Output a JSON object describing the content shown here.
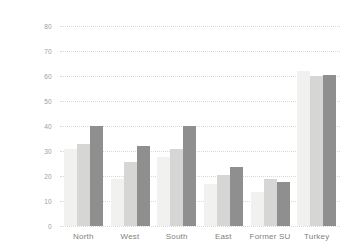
{
  "chart_data": {
    "type": "bar",
    "title": "",
    "subtitle": "",
    "xlabel": "",
    "ylabel": "",
    "categories": [
      "North",
      "West",
      "South",
      "East",
      "Former SU",
      "Turkey"
    ],
    "series": [
      {
        "name": "series-1",
        "color": "#f1f1ef",
        "values": [
          31,
          19,
          27.5,
          17,
          13.5,
          62
        ]
      },
      {
        "name": "series-2",
        "color": "#d6d6d4",
        "values": [
          33,
          25.5,
          31,
          20.5,
          19,
          60
        ]
      },
      {
        "name": "series-3",
        "color": "#8f8f8f",
        "values": [
          40,
          32,
          40,
          23.5,
          17.8,
          60.5
        ]
      }
    ],
    "ylim": [
      0,
      80
    ],
    "yticks": [
      0,
      10,
      20,
      30,
      40,
      50,
      60,
      70,
      80
    ],
    "ytick_labels": [
      "0",
      "10",
      "20",
      "30",
      "40",
      "50",
      "60",
      "70",
      "80"
    ],
    "grid": true,
    "grid_style": "dotted",
    "grid_color": "#d9d9d7",
    "legend": false,
    "legend_position": "none",
    "background_color": "#ffffff",
    "axis_text_color": "#8a8a8a"
  }
}
